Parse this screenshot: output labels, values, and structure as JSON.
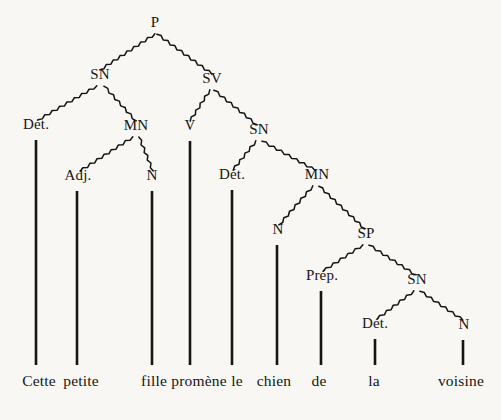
{
  "diagram": {
    "type": "syntax-tree",
    "language": "French",
    "sentence": "Cette petite fille promène le chien de la voisine",
    "background_color": "#f8f7f3",
    "ink_color": "#151515",
    "line_style": "hand-drawn-wavy",
    "nodes": [
      {
        "id": "P",
        "label": "P",
        "x": 155,
        "y": 30
      },
      {
        "id": "SN1",
        "label": "SN",
        "x": 100,
        "y": 82
      },
      {
        "id": "SV",
        "label": "SV",
        "x": 212,
        "y": 86
      },
      {
        "id": "DET1",
        "label": "Dét.",
        "x": 36,
        "y": 132
      },
      {
        "id": "MN1",
        "label": "MN",
        "x": 136,
        "y": 133
      },
      {
        "id": "V",
        "label": "V",
        "x": 190,
        "y": 133
      },
      {
        "id": "SN2",
        "label": "SN",
        "x": 259,
        "y": 137
      },
      {
        "id": "ADJ",
        "label": "Adj.",
        "x": 78,
        "y": 183
      },
      {
        "id": "N1",
        "label": "N",
        "x": 152,
        "y": 183
      },
      {
        "id": "DET2",
        "label": "Dét.",
        "x": 232,
        "y": 182
      },
      {
        "id": "MN2",
        "label": "MN",
        "x": 317,
        "y": 182
      },
      {
        "id": "N2",
        "label": "N",
        "x": 278,
        "y": 237
      },
      {
        "id": "SP",
        "label": "SP",
        "x": 366,
        "y": 241
      },
      {
        "id": "PREP",
        "label": "Prép.",
        "x": 322,
        "y": 283
      },
      {
        "id": "SN3",
        "label": "SN",
        "x": 417,
        "y": 287
      },
      {
        "id": "DET3",
        "label": "Dét.",
        "x": 375,
        "y": 331
      },
      {
        "id": "N3",
        "label": "N",
        "x": 464,
        "y": 332
      }
    ],
    "branches": [
      {
        "from": "P",
        "to": "SN1",
        "x1": 155,
        "y1": 34,
        "x2": 100,
        "y2": 70
      },
      {
        "from": "P",
        "to": "SV",
        "x1": 157,
        "y1": 34,
        "x2": 212,
        "y2": 74
      },
      {
        "from": "SN1",
        "to": "DET1",
        "x1": 97,
        "y1": 86,
        "x2": 38,
        "y2": 120
      },
      {
        "from": "SN1",
        "to": "MN1",
        "x1": 104,
        "y1": 86,
        "x2": 136,
        "y2": 121
      },
      {
        "from": "SV",
        "to": "V",
        "x1": 210,
        "y1": 90,
        "x2": 190,
        "y2": 121
      },
      {
        "from": "SV",
        "to": "SN2",
        "x1": 214,
        "y1": 90,
        "x2": 257,
        "y2": 125
      },
      {
        "from": "MN1",
        "to": "ADJ",
        "x1": 133,
        "y1": 137,
        "x2": 80,
        "y2": 171
      },
      {
        "from": "MN1",
        "to": "N1",
        "x1": 139,
        "y1": 137,
        "x2": 153,
        "y2": 171
      },
      {
        "from": "SN2",
        "to": "DET2",
        "x1": 256,
        "y1": 141,
        "x2": 233,
        "y2": 170
      },
      {
        "from": "SN2",
        "to": "MN2",
        "x1": 262,
        "y1": 141,
        "x2": 315,
        "y2": 170
      },
      {
        "from": "MN2",
        "to": "N2",
        "x1": 313,
        "y1": 186,
        "x2": 279,
        "y2": 225
      },
      {
        "from": "MN2",
        "to": "SP",
        "x1": 319,
        "y1": 186,
        "x2": 365,
        "y2": 229
      },
      {
        "from": "SP",
        "to": "PREP",
        "x1": 363,
        "y1": 245,
        "x2": 323,
        "y2": 271
      },
      {
        "from": "SP",
        "to": "SN3",
        "x1": 369,
        "y1": 245,
        "x2": 416,
        "y2": 275
      },
      {
        "from": "SN3",
        "to": "DET3",
        "x1": 414,
        "y1": 291,
        "x2": 377,
        "y2": 319
      },
      {
        "from": "SN3",
        "to": "N3",
        "x1": 420,
        "y1": 291,
        "x2": 463,
        "y2": 320
      }
    ],
    "stems": [
      {
        "from": "DET1",
        "word": "Cette",
        "x": 36,
        "y1": 140,
        "y2": 365
      },
      {
        "from": "ADJ",
        "word": "petite",
        "x": 77,
        "y1": 191,
        "y2": 365
      },
      {
        "from": "N1",
        "word": "fille",
        "x": 152,
        "y1": 191,
        "y2": 365
      },
      {
        "from": "V",
        "word": "promène",
        "x": 190,
        "y1": 141,
        "y2": 365
      },
      {
        "from": "DET2",
        "word": "le",
        "x": 232,
        "y1": 190,
        "y2": 365
      },
      {
        "from": "N2",
        "word": "chien",
        "x": 277,
        "y1": 245,
        "y2": 365
      },
      {
        "from": "PREP",
        "word": "de",
        "x": 321,
        "y1": 291,
        "y2": 365
      },
      {
        "from": "DET3",
        "word": "la",
        "x": 375,
        "y1": 339,
        "y2": 365
      },
      {
        "from": "N3",
        "word": "voisine",
        "x": 463,
        "y1": 340,
        "y2": 365
      }
    ],
    "terminals": [
      {
        "label": "Cette",
        "x": 39,
        "y": 373
      },
      {
        "label": "petite",
        "x": 81,
        "y": 373
      },
      {
        "label": "fille",
        "x": 154,
        "y": 373
      },
      {
        "label": "promène",
        "x": 199,
        "y": 373
      },
      {
        "label": "le",
        "x": 237,
        "y": 373
      },
      {
        "label": "chien",
        "x": 274,
        "y": 373
      },
      {
        "label": "de",
        "x": 319,
        "y": 373
      },
      {
        "label": "la",
        "x": 374,
        "y": 373
      },
      {
        "label": "voisine",
        "x": 461,
        "y": 373
      }
    ]
  }
}
